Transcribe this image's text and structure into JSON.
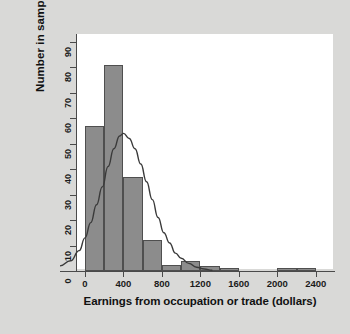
{
  "figure": {
    "background_color": "#d9d9d7",
    "panel_color": "#ffffff",
    "bar_fill_color": "#8c8c8c",
    "bar_edge_color": "#4f4f4f",
    "curve_color": "#3a3a3a",
    "axis_color": "#4a4a4a"
  },
  "chart_data": {
    "type": "bar",
    "title": "",
    "subtitle": "",
    "xlabel": "Earnings from occupation or trade (dollars)",
    "ylabel": "Number in sample",
    "xlim": [
      -260,
      2600
    ],
    "ylim": [
      0,
      93
    ],
    "grid": false,
    "legend": null,
    "bin_width": 200,
    "xticks": [
      0,
      400,
      800,
      1200,
      1600,
      2000,
      2400
    ],
    "xtick_labels": [
      "0",
      "400",
      "800",
      "1200",
      "1600",
      "2000",
      "2400"
    ],
    "yticks": [
      0,
      10,
      20,
      30,
      40,
      50,
      60,
      70,
      80,
      90
    ],
    "ytick_labels": [
      "0",
      "10",
      "20",
      "30",
      "40",
      "50",
      "60",
      "70",
      "80",
      "90"
    ],
    "bins": [
      {
        "x0": 0,
        "x1": 200,
        "value": 57
      },
      {
        "x0": 200,
        "x1": 400,
        "value": 81
      },
      {
        "x0": 400,
        "x1": 600,
        "value": 37
      },
      {
        "x0": 600,
        "x1": 800,
        "value": 12
      },
      {
        "x0": 800,
        "x1": 1000,
        "value": 2.5
      },
      {
        "x0": 1000,
        "x1": 1200,
        "value": 4
      },
      {
        "x0": 1200,
        "x1": 1400,
        "value": 2
      },
      {
        "x0": 1400,
        "x1": 1600,
        "value": 1
      },
      {
        "x0": 2000,
        "x1": 2200,
        "value": 1
      },
      {
        "x0": 2200,
        "x1": 2400,
        "value": 1
      }
    ],
    "overlay_curve": {
      "name": "normal-density-fit",
      "peak_x": 380,
      "peak_y": 54,
      "mean": 380,
      "std": 290,
      "points": [
        {
          "x": -260,
          "y": 2
        },
        {
          "x": -150,
          "y": 4
        },
        {
          "x": -60,
          "y": 8
        },
        {
          "x": 0,
          "y": 13
        },
        {
          "x": 60,
          "y": 19
        },
        {
          "x": 120,
          "y": 26
        },
        {
          "x": 180,
          "y": 33
        },
        {
          "x": 240,
          "y": 41
        },
        {
          "x": 300,
          "y": 48
        },
        {
          "x": 360,
          "y": 53
        },
        {
          "x": 400,
          "y": 54
        },
        {
          "x": 460,
          "y": 52
        },
        {
          "x": 520,
          "y": 48
        },
        {
          "x": 580,
          "y": 42
        },
        {
          "x": 640,
          "y": 35
        },
        {
          "x": 700,
          "y": 28
        },
        {
          "x": 760,
          "y": 21
        },
        {
          "x": 820,
          "y": 15
        },
        {
          "x": 880,
          "y": 11
        },
        {
          "x": 940,
          "y": 7
        },
        {
          "x": 1000,
          "y": 5
        },
        {
          "x": 1080,
          "y": 3
        },
        {
          "x": 1160,
          "y": 1.5
        },
        {
          "x": 1240,
          "y": 0.8
        },
        {
          "x": 1320,
          "y": 0.3
        }
      ]
    }
  }
}
